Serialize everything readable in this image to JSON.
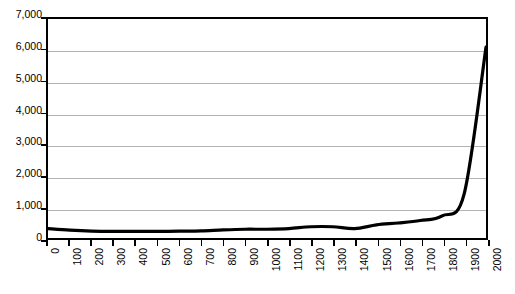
{
  "chart_data": {
    "type": "line",
    "title": "",
    "subtitle": "",
    "xlabel": "",
    "ylabel": "",
    "xlim": [
      0,
      2000
    ],
    "ylim": [
      0,
      7000
    ],
    "grid": true,
    "legend": false,
    "legend_position": "none",
    "line_color": "#000000",
    "gridline_color": "#b4b4b4",
    "axis_color": "#000000",
    "y_ticks": [
      "7,000",
      "6,000",
      "5,000",
      "4,000",
      "3,000",
      "2,000",
      "1,000",
      "0"
    ],
    "y_tick_values": [
      7000,
      6000,
      5000,
      4000,
      3000,
      2000,
      1000,
      0
    ],
    "x_ticks": [
      "0",
      "100",
      "200",
      "300",
      "400",
      "500",
      "600",
      "700",
      "800",
      "900",
      "1000",
      "1100",
      "1200",
      "1300",
      "1400",
      "1500",
      "1600",
      "1700",
      "1800",
      "1900",
      "2000"
    ],
    "x": [
      0,
      100,
      200,
      300,
      400,
      500,
      600,
      700,
      800,
      900,
      1000,
      1100,
      1200,
      1300,
      1400,
      1500,
      1600,
      1700,
      1800,
      1900,
      2000
    ],
    "values": [
      300,
      250,
      220,
      210,
      210,
      210,
      220,
      230,
      260,
      280,
      280,
      300,
      360,
      360,
      300,
      420,
      480,
      560,
      710,
      1400,
      6100
    ],
    "series": [
      {
        "name": "Population",
        "values": [
          300,
          250,
          220,
          210,
          210,
          210,
          220,
          230,
          260,
          280,
          280,
          300,
          360,
          360,
          300,
          420,
          480,
          560,
          710,
          1400,
          6100
        ]
      }
    ],
    "title_cropped_text": "",
    "annotations": []
  },
  "chart": {
    "title_sliver": ""
  }
}
